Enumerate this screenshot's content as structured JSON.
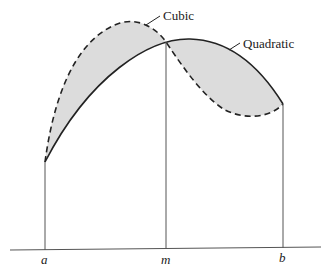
{
  "diagram": {
    "title": "",
    "curves": [
      {
        "name": "Cubic",
        "style": "dashed"
      },
      {
        "name": "Quadratic",
        "style": "solid"
      }
    ],
    "axis_labels": [
      "a",
      "m",
      "b"
    ],
    "shaded_region": "area between cubic and quadratic curves",
    "colors": {
      "stroke": "#222222",
      "fill": "#dcdcdc",
      "guides": "#555555"
    }
  },
  "labels": {
    "cubic": "Cubic",
    "quadratic": "Quadratic",
    "a": "a",
    "m": "m",
    "b": "b"
  }
}
